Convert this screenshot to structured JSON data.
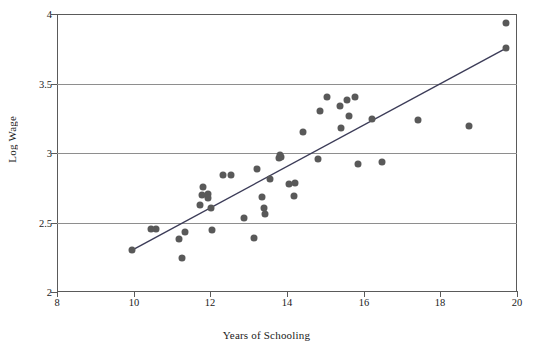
{
  "figure": {
    "axis_title_x": "Years of Schooling",
    "axis_title_y": "Log Wage",
    "marker_color": "#595959",
    "line_color": "#3c3c58",
    "grid_color": "#8e8e8e",
    "axis_color": "#5a5a5a"
  },
  "chart_data": {
    "type": "scatter",
    "title": "",
    "xlabel": "Years of Schooling",
    "ylabel": "Log Wage",
    "xlim": [
      8,
      20
    ],
    "ylim": [
      2,
      4
    ],
    "xticks": [
      8,
      10,
      12,
      14,
      16,
      18,
      20
    ],
    "yticks": [
      2,
      2.5,
      3,
      3.5,
      4
    ],
    "xtick_labels": [
      "8",
      "10",
      "12",
      "14",
      "16",
      "18",
      "20"
    ],
    "ytick_labels": [
      "2",
      "2.5",
      "3",
      "3.5",
      "4"
    ],
    "grid": "horizontal",
    "legend": "none",
    "series": [
      {
        "name": "observations",
        "marker": "filled-circle",
        "points": [
          [
            9.95,
            2.3
          ],
          [
            10.45,
            2.455
          ],
          [
            10.58,
            2.455
          ],
          [
            11.17,
            2.385
          ],
          [
            11.27,
            2.245
          ],
          [
            11.33,
            2.435
          ],
          [
            11.73,
            2.625
          ],
          [
            11.78,
            2.695
          ],
          [
            11.82,
            2.755
          ],
          [
            11.93,
            2.705
          ],
          [
            11.95,
            2.675
          ],
          [
            12.02,
            2.605
          ],
          [
            12.05,
            2.445
          ],
          [
            12.32,
            2.845
          ],
          [
            12.55,
            2.84
          ],
          [
            12.87,
            2.535
          ],
          [
            13.15,
            2.39
          ],
          [
            13.22,
            2.885
          ],
          [
            13.35,
            2.685
          ],
          [
            13.4,
            2.605
          ],
          [
            13.42,
            2.565
          ],
          [
            13.55,
            2.81
          ],
          [
            13.78,
            2.965
          ],
          [
            13.82,
            2.985
          ],
          [
            13.85,
            2.975
          ],
          [
            14.05,
            2.775
          ],
          [
            14.18,
            2.69
          ],
          [
            14.22,
            2.785
          ],
          [
            14.42,
            3.155
          ],
          [
            14.82,
            2.955
          ],
          [
            14.85,
            3.3
          ],
          [
            15.05,
            3.405
          ],
          [
            15.37,
            3.335
          ],
          [
            15.42,
            3.18
          ],
          [
            15.57,
            3.385
          ],
          [
            15.62,
            3.265
          ],
          [
            15.78,
            3.4
          ],
          [
            15.85,
            2.92
          ],
          [
            16.22,
            3.245
          ],
          [
            16.48,
            2.935
          ],
          [
            17.42,
            3.24
          ],
          [
            18.75,
            3.195
          ],
          [
            19.7,
            3.935
          ],
          [
            19.72,
            3.755
          ]
        ]
      }
    ],
    "fit_line": {
      "name": "regression-line",
      "x": [
        9.95,
        19.72
      ],
      "y": [
        2.3,
        3.755
      ]
    }
  }
}
